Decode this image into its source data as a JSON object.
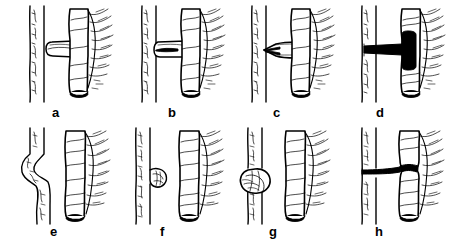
{
  "figure": {
    "background_color": "#ffffff",
    "ink_color": "#000000",
    "panel_rows": 2,
    "panel_columns": 4,
    "style": "black-and-white pen-and-ink anatomical line drawing",
    "width": 460,
    "height": 245
  },
  "panels": [
    {
      "id": "a",
      "label": "a",
      "label_x": 52,
      "label_y": 106,
      "row": 1,
      "column": 1,
      "description": "Vertical tubular vessel at left with stippled wall; thick appendiceal tube at right bearing a blunt side-branch that approaches but does not touch the vessel.",
      "features": [
        "left-vessel",
        "side-branch",
        "appendix-tube",
        "mesentery-hatching",
        "cut-end-ellipse"
      ],
      "contact": "none"
    },
    {
      "id": "b",
      "label": "b",
      "label_x": 168,
      "label_y": 106,
      "row": 1,
      "column": 2,
      "description": "The blunt side-branch now abuts and adheres to the wall of the left vessel.",
      "features": [
        "left-vessel",
        "side-branch",
        "appendix-tube",
        "mesentery-hatching",
        "cut-end-ellipse"
      ],
      "contact": "touching"
    },
    {
      "id": "c",
      "label": "c",
      "label_x": 273,
      "label_y": 106,
      "row": 1,
      "column": 3,
      "description": "The branch has funnelled into and penetrated the vessel wall, forming a narrow waisted communication.",
      "features": [
        "left-vessel",
        "funnelled-tract",
        "appendix-tube",
        "mesentery-hatching",
        "cut-end-ellipse"
      ],
      "contact": "penetrating"
    },
    {
      "id": "d",
      "label": "d",
      "label_x": 376,
      "label_y": 106,
      "row": 1,
      "column": 4,
      "description": "A patent fistula: solid black lumen runs from the vessel horizontally into a black cavity within the appendiceal tube.",
      "features": [
        "left-vessel",
        "black-fistula-tract",
        "black-lumen-cavity",
        "appendix-tube",
        "mesentery-hatching",
        "cut-end-ellipse"
      ],
      "contact": "patent-fistula"
    },
    {
      "id": "e",
      "label": "e",
      "label_x": 50,
      "label_y": 225,
      "row": 2,
      "column": 1,
      "description": "Left vessel shows an S-shaped kink or deviation; appendiceal tube stands separate at right.",
      "features": [
        "kinked-vessel",
        "appendix-tube",
        "mesentery-hatching",
        "cut-end-ellipse"
      ],
      "contact": "none"
    },
    {
      "id": "f",
      "label": "f",
      "label_x": 160,
      "label_y": 225,
      "row": 2,
      "column": 2,
      "description": "A small rounded nodule or outpouching bulges from the right side of the vessel wall.",
      "features": [
        "left-vessel",
        "small-nodule",
        "appendix-tube",
        "mesentery-hatching",
        "cut-end-ellipse"
      ],
      "contact": "none"
    },
    {
      "id": "g",
      "label": "g",
      "label_x": 269,
      "label_y": 225,
      "row": 2,
      "column": 3,
      "description": "A larger rounded aneurysmal swelling encircles and distends the vessel.",
      "features": [
        "left-vessel",
        "large-nodule",
        "appendix-tube",
        "mesentery-hatching",
        "cut-end-ellipse"
      ],
      "contact": "none"
    },
    {
      "id": "h",
      "label": "h",
      "label_x": 375,
      "label_y": 225,
      "row": 2,
      "column": 4,
      "description": "A thin dark fibrous cord tethers the vessel directly to the appendiceal tube, producing a constricting band.",
      "features": [
        "left-vessel",
        "fibrous-cord",
        "constriction-band",
        "appendix-tube",
        "mesentery-hatching",
        "cut-end-ellipse"
      ],
      "contact": "tethered-band"
    }
  ]
}
